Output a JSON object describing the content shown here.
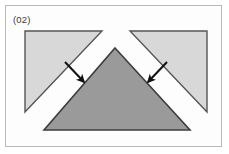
{
  "figure": {
    "label": "(02)",
    "caption_text": "(02)",
    "domain": "geometric-assembly-diagram",
    "frame": {
      "x": 5,
      "y": 5,
      "width": 217,
      "height": 142,
      "border_color": "#b9b9b9",
      "background_color": "#fdfdfd"
    },
    "page_background_color": "#ffffff"
  },
  "colors": {
    "light_triangle_fill": "#d8d8d8",
    "light_triangle_stroke": "#555555",
    "center_triangle_fill": "#9a9a9a",
    "center_triangle_stroke": "#3d3d3d",
    "arrow_color": "#111111",
    "frame_border": "#b9b9b9",
    "label_text": "#3a3a3a"
  },
  "shapes": [
    {
      "name": "left-upper-triangle",
      "kind": "right-triangle",
      "orientation": "right-angle-top-left",
      "points": "25,31 102,31 25,112",
      "fill": "#d8d8d8",
      "stroke": "#555555",
      "stroke_width": 1.4
    },
    {
      "name": "right-upper-triangle",
      "kind": "right-triangle",
      "orientation": "right-angle-top-right",
      "points": "207,31 130,31 207,112",
      "fill": "#d8d8d8",
      "stroke": "#555555",
      "stroke_width": 1.4
    },
    {
      "name": "center-triangle",
      "kind": "isosceles-triangle",
      "orientation": "apex-up",
      "points": "115,48 190,130 44,130",
      "fill": "#9a9a9a",
      "stroke": "#3d3d3d",
      "stroke_width": 1.6
    }
  ],
  "arrows": [
    {
      "name": "left-arrow",
      "direction": "down-right",
      "from_x": 65,
      "from_y": 62,
      "to_x": 86,
      "to_y": 84,
      "color": "#111111",
      "shaft_width": 2,
      "head_size": 9
    },
    {
      "name": "right-arrow",
      "direction": "down-left",
      "from_x": 167,
      "from_y": 62,
      "to_x": 146,
      "to_y": 84,
      "color": "#111111",
      "shaft_width": 2,
      "head_size": 9
    }
  ]
}
